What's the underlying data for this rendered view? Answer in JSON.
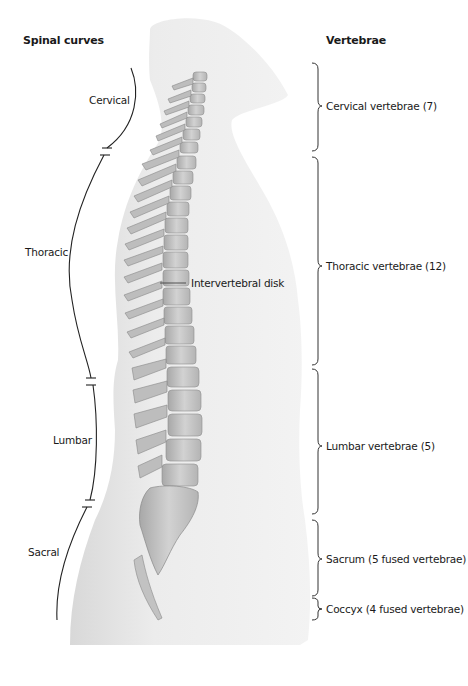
{
  "headings": {
    "spinal_curves": "Spinal curves",
    "vertebrae": "Vertebrae"
  },
  "spinal_curves": [
    {
      "label": "Cervical"
    },
    {
      "label": "Thoracic"
    },
    {
      "label": "Lumbar"
    },
    {
      "label": "Sacral"
    }
  ],
  "vertebrae": [
    {
      "label": "Cervical vertebrae (7)"
    },
    {
      "label": "Thoracic vertebrae (12)"
    },
    {
      "label": "Lumbar vertebrae (5)"
    },
    {
      "label": "Sacrum (5 fused vertebrae)"
    },
    {
      "label": "Coccyx (4 fused vertebrae)"
    }
  ],
  "annotations": {
    "intervertebral_disk": "Intervertebral disk"
  },
  "colors": {
    "body_silhouette": "#ebebeb",
    "bone": "#c9c9c9",
    "bone_shadow": "#9a9a9a",
    "line": "#333333"
  }
}
